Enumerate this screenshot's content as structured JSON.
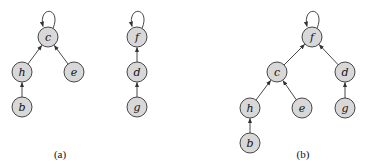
{
  "figure": {
    "colors": {
      "node_fill": "#d8d8d8",
      "stroke": "#333333",
      "text": "#111111"
    },
    "node_radius": 10,
    "panels": [
      {
        "id": "a",
        "caption": "(a)",
        "caption_pos": [
          60,
          158
        ],
        "nodes": [
          {
            "id": "c",
            "label": "c",
            "x": 48,
            "y": 37,
            "self_loop": true
          },
          {
            "id": "h",
            "label": "h",
            "x": 22,
            "y": 72
          },
          {
            "id": "e",
            "label": "e",
            "x": 74,
            "y": 72
          },
          {
            "id": "b",
            "label": "b",
            "x": 22,
            "y": 107
          },
          {
            "id": "f",
            "label": "f",
            "x": 137,
            "y": 37,
            "self_loop": true
          },
          {
            "id": "d",
            "label": "d",
            "x": 137,
            "y": 72
          },
          {
            "id": "g",
            "label": "g",
            "x": 137,
            "y": 107
          }
        ],
        "edges": [
          {
            "from": "h",
            "to": "c"
          },
          {
            "from": "e",
            "to": "c"
          },
          {
            "from": "b",
            "to": "h"
          },
          {
            "from": "d",
            "to": "f"
          },
          {
            "from": "g",
            "to": "d"
          }
        ]
      },
      {
        "id": "b",
        "caption": "(b)",
        "caption_pos": [
          303,
          158
        ],
        "nodes": [
          {
            "id": "f",
            "label": "f",
            "x": 312,
            "y": 37,
            "self_loop": true
          },
          {
            "id": "c",
            "label": "c",
            "x": 277,
            "y": 72
          },
          {
            "id": "d",
            "label": "d",
            "x": 345,
            "y": 72
          },
          {
            "id": "h",
            "label": "h",
            "x": 250,
            "y": 108
          },
          {
            "id": "e",
            "label": "e",
            "x": 302,
            "y": 108
          },
          {
            "id": "g",
            "label": "g",
            "x": 345,
            "y": 108
          },
          {
            "id": "b",
            "label": "b",
            "x": 250,
            "y": 143
          }
        ],
        "edges": [
          {
            "from": "c",
            "to": "f"
          },
          {
            "from": "d",
            "to": "f"
          },
          {
            "from": "h",
            "to": "c"
          },
          {
            "from": "e",
            "to": "c"
          },
          {
            "from": "g",
            "to": "d"
          },
          {
            "from": "b",
            "to": "h"
          }
        ]
      }
    ]
  }
}
